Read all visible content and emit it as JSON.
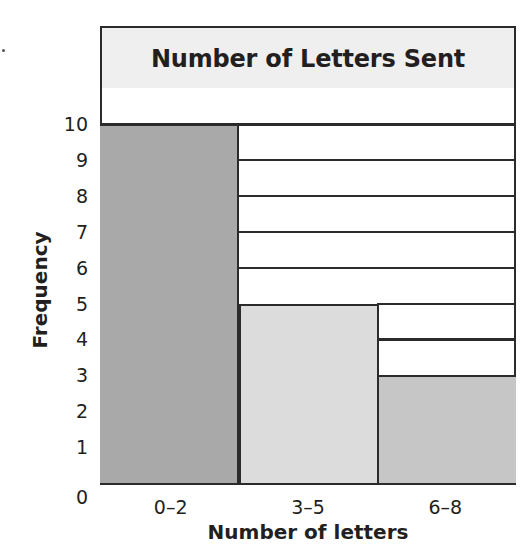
{
  "chart_data": {
    "type": "bar",
    "subtype": "histogram",
    "title": "Number of Letters Sent",
    "xlabel": "Number of letters",
    "ylabel": "Frequency",
    "categories": [
      "0–2",
      "3–5",
      "6–8"
    ],
    "values": [
      10,
      5,
      3
    ],
    "ylim": [
      0,
      11
    ],
    "yticks": [
      0,
      1,
      2,
      3,
      4,
      5,
      6,
      7,
      8,
      9,
      10
    ],
    "grid": true,
    "legend": null,
    "bar_colors": [
      "#a9a9a9",
      "#dcdcdc",
      "#c6c6c6"
    ]
  },
  "title": "Number of Letters Sent",
  "xlabel": "Number of letters",
  "ylabel": "Frequency",
  "x_ticks": [
    "0–2",
    "3–5",
    "6–8"
  ],
  "y_ticks": [
    "0",
    "1",
    "2",
    "3",
    "4",
    "5",
    "6",
    "7",
    "8",
    "9",
    "10"
  ],
  "colors": {
    "border": "#2b2b2b",
    "title_bg": "#efefef",
    "bar_0_2": "#a9a9a9",
    "bar_3_5": "#dcdcdc",
    "bar_6_8": "#c6c6c6"
  }
}
